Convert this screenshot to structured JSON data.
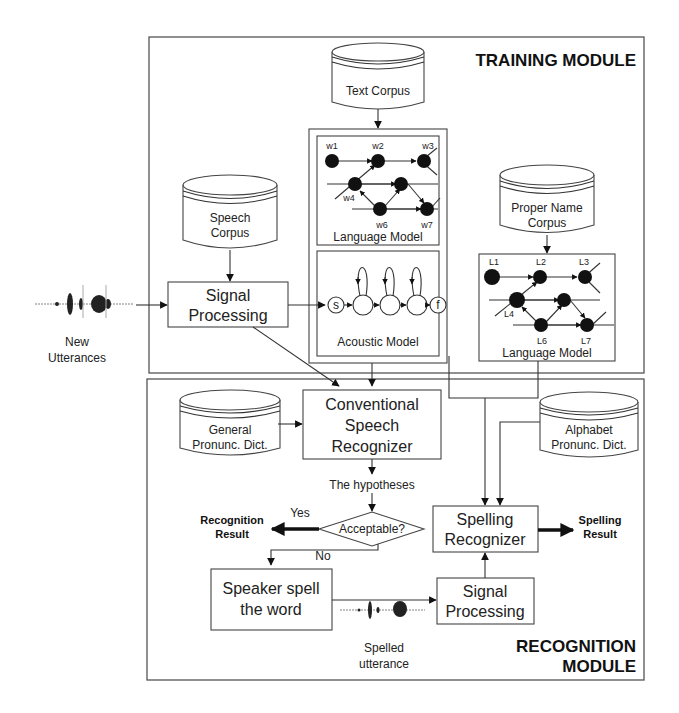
{
  "modules": {
    "training": {
      "title": "TRAINING MODULE"
    },
    "recognition": {
      "title_line1": "RECOGNITION",
      "title_line2": "MODULE"
    }
  },
  "databases": {
    "text_corpus": {
      "line1": "Text Corpus"
    },
    "speech_corpus": {
      "line1": "Speech",
      "line2": "Corpus"
    },
    "proper_name_corpus": {
      "line1": "Proper Name",
      "line2": "Corpus"
    },
    "general_pronunc_dict": {
      "line1": "General",
      "line2": "Pronunc. Dict."
    },
    "alphabet_pronunc_dict": {
      "line1": "Alphabet",
      "line2": "Pronunc. Dict."
    }
  },
  "processes": {
    "signal_processing_training": {
      "line1": "Signal",
      "line2": "Processing"
    },
    "conventional_recognizer": {
      "line1": "Conventional",
      "line2": "Speech",
      "line3": "Recognizer"
    },
    "spelling_recognizer": {
      "line1": "Spelling",
      "line2": "Recognizer"
    },
    "speaker_spell": {
      "line1": "Speaker spell",
      "line2": "the word"
    },
    "signal_processing_recognition": {
      "line1": "Signal",
      "line2": "Processing"
    }
  },
  "models": {
    "word_language_model": {
      "label": "Language Model",
      "nodes": [
        "w1",
        "w2",
        "w3",
        "w4",
        "w6",
        "w7"
      ]
    },
    "acoustic_model": {
      "label": "Acoustic Model",
      "start": "s",
      "final": "f"
    },
    "letter_language_model": {
      "label": "Language Model",
      "nodes": [
        "L1",
        "L2",
        "L3",
        "L4",
        "L6",
        "L7"
      ]
    }
  },
  "decision": {
    "label": "Acceptable?",
    "yes": "Yes",
    "no": "No"
  },
  "labels": {
    "new_utterances_line1": "New",
    "new_utterances_line2": "Utterances",
    "hypotheses": "The hypotheses",
    "recognition_result_line1": "Recognition",
    "recognition_result_line2": "Result",
    "spelling_result_line1": "Spelling",
    "spelling_result_line2": "Result",
    "spelled_utterance_line1": "Spelled",
    "spelled_utterance_line2": "utterance"
  },
  "colors": {
    "ink": "#222222",
    "frame": "#555555",
    "background": "#ffffff"
  }
}
